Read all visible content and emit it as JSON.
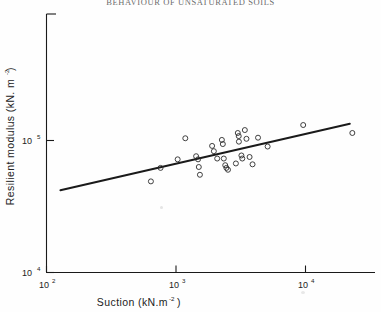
{
  "figure": {
    "title": "BEHAVIOUR OF UNSATURATED SOILS",
    "background_color": "#fefefe",
    "ink_color": "#1a1a1a"
  },
  "axes": {
    "x": {
      "label": "Suction  (kN.m",
      "label_exponent": "-2",
      "label_close": ")",
      "scale": "log",
      "ticks": [
        {
          "value": 100,
          "mantissa": "10",
          "exponent": "2"
        },
        {
          "value": 1000,
          "mantissa": "10",
          "exponent": "3"
        },
        {
          "value": 10000,
          "mantissa": "10",
          "exponent": "4"
        }
      ],
      "range": [
        100,
        26000
      ]
    },
    "y": {
      "label": "Resilient modulus (kN. m",
      "label_exponent": "-2",
      "label_close": ")",
      "scale": "log",
      "ticks": [
        {
          "value": 10000,
          "mantissa": "10",
          "exponent": "4"
        },
        {
          "value": 100000,
          "mantissa": "10",
          "exponent": "5"
        }
      ],
      "range": [
        10000,
        200000
      ]
    }
  },
  "chart_data": {
    "type": "scatter",
    "title": "BEHAVIOUR OF UNSATURATED SOILS",
    "xlabel": "Suction (kN.m^-2)",
    "ylabel": "Resilient modulus (kN.m^-2)",
    "xscale": "log",
    "yscale": "log",
    "xlim": [
      100,
      26000
    ],
    "ylim": [
      10000,
      200000
    ],
    "grid": false,
    "legend": "none",
    "marker": "open-circle",
    "series": [
      {
        "name": "measurements",
        "points": [
          {
            "x": 640,
            "y": 49000
          },
          {
            "x": 760,
            "y": 62000
          },
          {
            "x": 1030,
            "y": 72000
          },
          {
            "x": 1180,
            "y": 104000
          },
          {
            "x": 1430,
            "y": 76000
          },
          {
            "x": 1480,
            "y": 72000
          },
          {
            "x": 1500,
            "y": 63000
          },
          {
            "x": 1530,
            "y": 55000
          },
          {
            "x": 1900,
            "y": 91000
          },
          {
            "x": 1960,
            "y": 83000
          },
          {
            "x": 2080,
            "y": 73000
          },
          {
            "x": 2260,
            "y": 101000
          },
          {
            "x": 2300,
            "y": 94000
          },
          {
            "x": 2340,
            "y": 73000
          },
          {
            "x": 2400,
            "y": 65000
          },
          {
            "x": 2450,
            "y": 62000
          },
          {
            "x": 2520,
            "y": 60000
          },
          {
            "x": 2900,
            "y": 67000
          },
          {
            "x": 3000,
            "y": 114000
          },
          {
            "x": 3050,
            "y": 108000
          },
          {
            "x": 3060,
            "y": 98000
          },
          {
            "x": 3200,
            "y": 77000
          },
          {
            "x": 3250,
            "y": 73000
          },
          {
            "x": 3400,
            "y": 120000
          },
          {
            "x": 3500,
            "y": 103000
          },
          {
            "x": 3700,
            "y": 75000
          },
          {
            "x": 3900,
            "y": 66000
          },
          {
            "x": 4300,
            "y": 105000
          },
          {
            "x": 5100,
            "y": 90000
          },
          {
            "x": 9600,
            "y": 131000
          },
          {
            "x": 23000,
            "y": 114000
          }
        ]
      }
    ],
    "fit_line": {
      "name": "best-fit line",
      "x_start": 128,
      "y_start": 42000,
      "x_end": 22000,
      "y_end": 134000
    }
  }
}
